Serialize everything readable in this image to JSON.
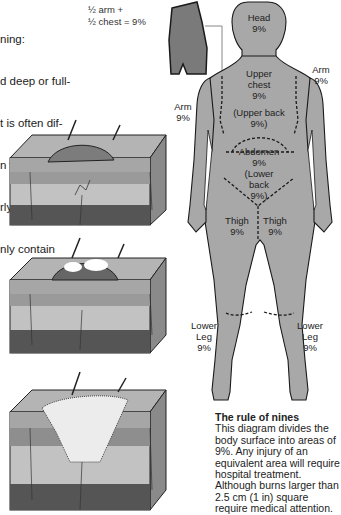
{
  "intro_text": {
    "lines": [
      "ning:",
      "d deep or full-",
      "t is often dif-",
      "n the different",
      "rly stages. A",
      "nly contain"
    ]
  },
  "inset": {
    "label_line1": "½ arm +",
    "label_line2": "½ chest = 9%"
  },
  "body_regions": [
    {
      "id": "head",
      "name": "Head",
      "pct": "9%"
    },
    {
      "id": "arm_right",
      "name": "Arm",
      "pct": "9%"
    },
    {
      "id": "arm_left",
      "name": "Arm",
      "pct": "9%"
    },
    {
      "id": "upper_chest",
      "name": "Upper\nchest",
      "pct": "9%"
    },
    {
      "id": "upper_back",
      "name": "(Upper back",
      "pct": "9%)"
    },
    {
      "id": "abdomen",
      "name": "Abdomen",
      "pct": "9%"
    },
    {
      "id": "lower_back",
      "name": "(Lower\nback",
      "pct": "9%)"
    },
    {
      "id": "thigh_left",
      "name": "Thigh",
      "pct": "9%"
    },
    {
      "id": "thigh_right",
      "name": "Thigh",
      "pct": "9%"
    },
    {
      "id": "lower_leg_left",
      "name": "Lower\nLeg",
      "pct": "9%"
    },
    {
      "id": "lower_leg_right",
      "name": "Lower\nLeg",
      "pct": "9%"
    }
  ],
  "skin_illustrations": [
    {
      "id": "superficial",
      "description": "skin cross-section with reddened dome"
    },
    {
      "id": "partial_thickness",
      "description": "skin cross-section with blister"
    },
    {
      "id": "full_thickness",
      "description": "skin cross-section with deep charred burn"
    }
  ],
  "caption": {
    "title": "The rule of nines",
    "body": "This diagram divides the body surface into areas of 9%. Any injury of an equivalent area will require hospital treatment. Although burns larger than 2.5 cm (1 in) square require medical attention."
  },
  "colors": {
    "body_fill": "#a8a8a8",
    "inset_fill": "#7a7a7a",
    "outline": "#1a1a1a",
    "skin_top": "#b0b0b0",
    "skin_deep": "#555555"
  }
}
